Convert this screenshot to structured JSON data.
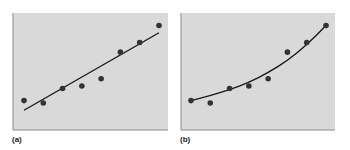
{
  "chart_data": [
    {
      "type": "scatter",
      "panel_label": "(a)",
      "fit": "linear",
      "title": "",
      "xlabel": "",
      "ylabel": "",
      "grid": false,
      "points": [
        {
          "x": 1,
          "y": 1.1
        },
        {
          "x": 2,
          "y": 1.0
        },
        {
          "x": 3,
          "y": 1.6
        },
        {
          "x": 4,
          "y": 1.7
        },
        {
          "x": 5,
          "y": 2.0
        },
        {
          "x": 6,
          "y": 3.1
        },
        {
          "x": 7,
          "y": 3.5
        },
        {
          "x": 8,
          "y": 4.2
        }
      ],
      "fit_line": {
        "x": [
          1,
          8
        ],
        "y": [
          0.7,
          3.9
        ]
      }
    },
    {
      "type": "scatter",
      "panel_label": "(b)",
      "fit": "curve",
      "title": "",
      "xlabel": "",
      "ylabel": "",
      "grid": false,
      "points": [
        {
          "x": 1,
          "y": 1.1
        },
        {
          "x": 2,
          "y": 1.0
        },
        {
          "x": 3,
          "y": 1.6
        },
        {
          "x": 4,
          "y": 1.7
        },
        {
          "x": 5,
          "y": 2.0
        },
        {
          "x": 6,
          "y": 3.1
        },
        {
          "x": 7,
          "y": 3.5
        },
        {
          "x": 8,
          "y": 4.2
        }
      ],
      "fit_curve": {
        "x": [
          1,
          2,
          3,
          4,
          5,
          6,
          7,
          8
        ],
        "y": [
          1.1,
          1.3,
          1.55,
          1.85,
          2.25,
          2.75,
          3.4,
          4.2
        ]
      }
    }
  ],
  "style": {
    "plot_bg": "#d9d9d9",
    "axis_color": "#8a8a8a",
    "point_color": "#333333",
    "line_color": "#1a1a1a"
  },
  "panels": {
    "a": {
      "label": "(a)"
    },
    "b": {
      "label": "(b)"
    }
  }
}
